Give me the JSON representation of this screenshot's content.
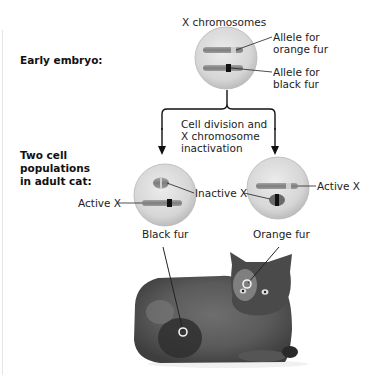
{
  "stages": {
    "early": "Early embryo:",
    "adult_line1": "Two cell",
    "adult_line2": "populations",
    "adult_line3": "in adult cat:"
  },
  "embryo_cell": {
    "title": "X chromosomes",
    "allele_orange_line1": "Allele for",
    "allele_orange_line2": "orange fur",
    "allele_black_line1": "Allele for",
    "allele_black_line2": "black fur"
  },
  "process": {
    "line1": "Cell division and",
    "line2": "X chromosome",
    "line3": "inactivation"
  },
  "left_cell": {
    "active_label": "Active X",
    "phenotype": "Black fur"
  },
  "shared": {
    "inactive_label": "Inactive X"
  },
  "right_cell": {
    "active_label": "Active X",
    "phenotype": "Orange fur"
  },
  "photo": {
    "subject": "tortoiseshell-cat"
  },
  "colors": {
    "cell_fill": "#d9d9d9",
    "chromosome": "#8a8a8a",
    "black_allele_band": "#111111",
    "line": "#222222"
  }
}
